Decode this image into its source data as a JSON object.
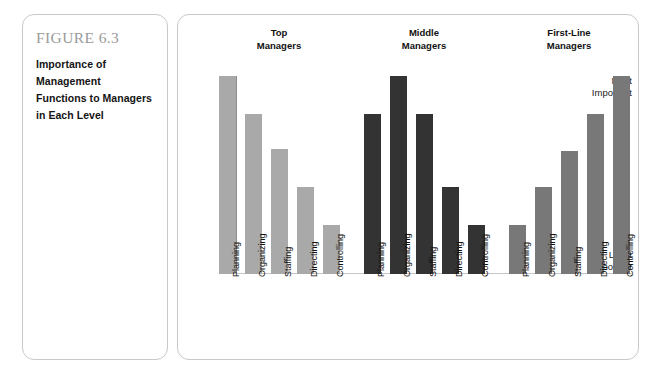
{
  "figure": {
    "number": "FIGURE 6.3",
    "title": "Importance of Management Functions to Managers in Each Level"
  },
  "chart_data": {
    "type": "bar",
    "title": "Importance of Management Functions to Managers in Each Level",
    "xlabel": "",
    "ylabel": "",
    "grid": false,
    "legend_position": "none",
    "axis": {
      "y_top_label": "Most\nImportant",
      "y_bottom_label": "Least\nImportant",
      "ylim": [
        0,
        100
      ]
    },
    "categories": [
      "Planning",
      "Organizing",
      "Staffing",
      "Directing",
      "Controlling"
    ],
    "series": [
      {
        "name": "Top Managers",
        "header": "Top\nManagers",
        "color": "#a9a9a9",
        "values": [
          100,
          81,
          63,
          44,
          25
        ]
      },
      {
        "name": "Middle Managers",
        "header": "Middle\nManagers",
        "color": "#333333",
        "values": [
          81,
          100,
          81,
          44,
          25
        ]
      },
      {
        "name": "First-Line Managers",
        "header": "First-Line\nManagers",
        "color": "#787878",
        "values": [
          25,
          44,
          62,
          81,
          100
        ]
      }
    ]
  }
}
